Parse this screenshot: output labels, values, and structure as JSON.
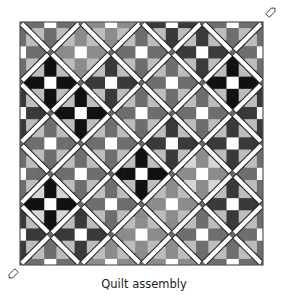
{
  "figure": {
    "caption": "Quilt assembly",
    "width": 288,
    "height": 300
  },
  "quilt": {
    "origin": [
      20,
      22
    ],
    "size": 243,
    "step": 30.375,
    "lattice_n": 8,
    "border_color": "#555555",
    "sash_color": "#ffffff",
    "sash_outline": "#222222",
    "cornerstone_color": "#6a6a6a",
    "center_color": "#ffffff",
    "colors": {
      "black": "#111111",
      "dark": "#3a3a3a",
      "mid": "#6e6e6e",
      "midlight": "#8c8c8c",
      "light": "#bdbdbd",
      "pale": "#d6d6d6"
    },
    "setting_triangles": [
      {
        "pos": "top-left-corner",
        "color": "#8a8a8a"
      },
      {
        "pos": "top",
        "index": 0,
        "color": "#5a5a5a"
      },
      {
        "pos": "top",
        "index": 1,
        "color": "#5e5e5e"
      },
      {
        "pos": "top",
        "index": 2,
        "color": "#1e1e1e"
      },
      {
        "pos": "top",
        "index": 3,
        "color": "#6a6a6a"
      },
      {
        "pos": "left",
        "index": 0,
        "color": "#7a7a7a"
      },
      {
        "pos": "left",
        "index": 1,
        "color": "#404040"
      },
      {
        "pos": "left",
        "index": 2,
        "color": "#3a3a3a"
      },
      {
        "pos": "left",
        "index": 3,
        "color": "#262626"
      },
      {
        "pos": "right",
        "index": 0,
        "color": "#606060"
      },
      {
        "pos": "right",
        "index": 1,
        "color": "#4a4a4a"
      },
      {
        "pos": "right",
        "index": 2,
        "color": "#5a5a5a"
      },
      {
        "pos": "right",
        "index": 3,
        "color": "#6a6a6a"
      },
      {
        "pos": "bottom",
        "index": 0,
        "color": "#777777"
      },
      {
        "pos": "bottom",
        "index": 1,
        "color": "#2a2a2a"
      },
      {
        "pos": "bottom",
        "index": 2,
        "color": "#1c1c1c"
      },
      {
        "pos": "bottom",
        "index": 3,
        "color": "#5a5a5a"
      }
    ],
    "blocks": [
      {
        "a": 1,
        "b": 0,
        "arm": "mid",
        "corner": "light"
      },
      {
        "a": 3,
        "b": 0,
        "arm": "midlight",
        "corner": "light"
      },
      {
        "a": 5,
        "b": 0,
        "arm": "dark",
        "corner": "light"
      },
      {
        "a": 7,
        "b": 0,
        "arm": "mid",
        "corner": "light"
      },
      {
        "a": 0,
        "b": 1,
        "arm": "mid",
        "corner": "light"
      },
      {
        "a": 2,
        "b": 1,
        "arm": "midlight",
        "corner": "light"
      },
      {
        "a": 4,
        "b": 1,
        "arm": "mid",
        "corner": "light"
      },
      {
        "a": 6,
        "b": 1,
        "arm": "dark",
        "corner": "light"
      },
      {
        "a": 8,
        "b": 1,
        "arm": "mid",
        "corner": "light"
      },
      {
        "a": 1,
        "b": 2,
        "arm": "black",
        "corner": "light"
      },
      {
        "a": 3,
        "b": 2,
        "arm": "dark",
        "corner": "light"
      },
      {
        "a": 5,
        "b": 2,
        "arm": "mid",
        "corner": "light"
      },
      {
        "a": 7,
        "b": 2,
        "arm": "black",
        "corner": "light"
      },
      {
        "a": 0,
        "b": 3,
        "arm": "dark",
        "corner": "light"
      },
      {
        "a": 2,
        "b": 3,
        "arm": "black",
        "corner": "light"
      },
      {
        "a": 4,
        "b": 3,
        "arm": "mid",
        "corner": "light"
      },
      {
        "a": 6,
        "b": 3,
        "arm": "mid",
        "corner": "light"
      },
      {
        "a": 8,
        "b": 3,
        "arm": "dark",
        "corner": "light"
      },
      {
        "a": 1,
        "b": 4,
        "arm": "mid",
        "corner": "light"
      },
      {
        "a": 3,
        "b": 4,
        "arm": "mid",
        "corner": "light"
      },
      {
        "a": 5,
        "b": 4,
        "arm": "dark",
        "corner": "light"
      },
      {
        "a": 7,
        "b": 4,
        "arm": "dark",
        "corner": "light"
      },
      {
        "a": 0,
        "b": 5,
        "arm": "mid",
        "corner": "light"
      },
      {
        "a": 2,
        "b": 5,
        "arm": "mid",
        "corner": "light"
      },
      {
        "a": 4,
        "b": 5,
        "arm": "black",
        "corner": "light"
      },
      {
        "a": 6,
        "b": 5,
        "arm": "midlight",
        "corner": "pale"
      },
      {
        "a": 8,
        "b": 5,
        "arm": "mid",
        "corner": "light"
      },
      {
        "a": 1,
        "b": 6,
        "arm": "black",
        "corner": "pale"
      },
      {
        "a": 3,
        "b": 6,
        "arm": "mid",
        "corner": "light"
      },
      {
        "a": 5,
        "b": 6,
        "arm": "midlight",
        "corner": "light"
      },
      {
        "a": 7,
        "b": 6,
        "arm": "dark",
        "corner": "light"
      },
      {
        "a": 0,
        "b": 7,
        "arm": "dark",
        "corner": "light"
      },
      {
        "a": 2,
        "b": 7,
        "arm": "dark",
        "corner": "light"
      },
      {
        "a": 4,
        "b": 7,
        "arm": "midlight",
        "corner": "light"
      },
      {
        "a": 6,
        "b": 7,
        "arm": "mid",
        "corner": "light"
      },
      {
        "a": 8,
        "b": 7,
        "arm": "mid",
        "corner": "light"
      },
      {
        "a": 1,
        "b": 8,
        "arm": "mid",
        "corner": "light"
      },
      {
        "a": 3,
        "b": 8,
        "arm": "midlight",
        "corner": "light"
      },
      {
        "a": 5,
        "b": 8,
        "arm": "midlight",
        "corner": "light"
      },
      {
        "a": 7,
        "b": 8,
        "arm": "mid",
        "corner": "light"
      }
    ],
    "markers": [
      {
        "name": "pin-marker-top-right",
        "x": 271,
        "y": 12,
        "angle": -45
      },
      {
        "name": "pin-marker-bottom-left",
        "x": 13,
        "y": 274,
        "angle": 135
      }
    ]
  }
}
